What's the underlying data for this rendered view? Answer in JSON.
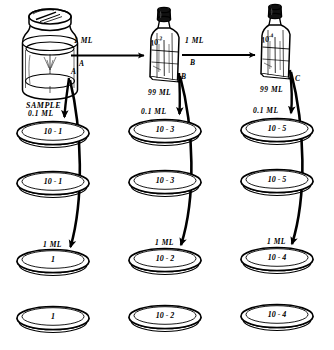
{
  "figure": {
    "ink_color": "#000000",
    "background_color": "#ffffff"
  },
  "sample": {
    "container_name": "sample-jar",
    "caption": "SAMPLE",
    "transfer_volume": "0.1 ML",
    "branch_letter": "A"
  },
  "bottles": [
    {
      "id": "bottle-10-2",
      "label": "10-2",
      "label_exp": "10⁻²",
      "volume": "99 ML",
      "branch_letter": "B"
    },
    {
      "id": "bottle-10-4",
      "label": "10-4",
      "label_exp": "10⁻⁴",
      "volume": "99 ML",
      "branch_letter": "C"
    }
  ],
  "transfer_arrows": [
    {
      "id": "arrow-sample-to-bottle1",
      "volume": "1 ML",
      "letter": "A"
    },
    {
      "id": "arrow-bottle1-to-bottle2",
      "volume": "1 ML",
      "letter": "B"
    }
  ],
  "columns": [
    {
      "id": "column-a",
      "source_letter": "A",
      "top_volume": "0.1 ML",
      "bottom_volume": "1 ML",
      "top_dishes": [
        {
          "id": "dish-10-1-top",
          "label": "10 - 1"
        },
        {
          "id": "dish-10-1-bottom",
          "label": "10 - 1"
        }
      ],
      "bottom_dishes": [
        {
          "id": "dish-1-top",
          "label": "1"
        },
        {
          "id": "dish-1-bottom",
          "label": "1"
        }
      ]
    },
    {
      "id": "column-b",
      "source_letter": "B",
      "top_volume": "0.1 ML",
      "bottom_volume": "1 ML",
      "top_dishes": [
        {
          "id": "dish-10-3-top",
          "label": "10 - 3"
        },
        {
          "id": "dish-10-3-bottom",
          "label": "10 - 3"
        }
      ],
      "bottom_dishes": [
        {
          "id": "dish-10-2-top",
          "label": "10 - 2"
        },
        {
          "id": "dish-10-2-bottom",
          "label": "10 - 2"
        }
      ]
    },
    {
      "id": "column-c",
      "source_letter": "C",
      "top_volume": "0.1 ML",
      "bottom_volume": "1 ML",
      "top_dishes": [
        {
          "id": "dish-10-5-top",
          "label": "10 - 5"
        },
        {
          "id": "dish-10-5-bottom",
          "label": "10 - 5"
        }
      ],
      "bottom_dishes": [
        {
          "id": "dish-10-4-top",
          "label": "10 - 4"
        },
        {
          "id": "dish-10-4-bottom",
          "label": "10 - 4"
        }
      ]
    }
  ]
}
